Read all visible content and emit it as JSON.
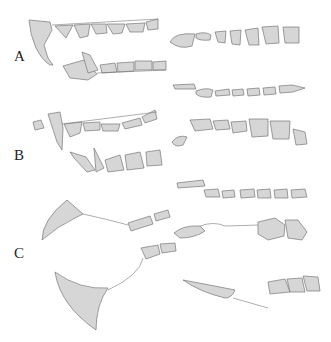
{
  "figure": {
    "panels": [
      {
        "label": "A",
        "description": "Upper and lower jaw dentition, lateral and occlusal views"
      },
      {
        "label": "B",
        "description": "Upper and lower jaw dentition with canines, lateral and occlusal views"
      },
      {
        "label": "C",
        "description": "Mandible outlines with isolated teeth rows and occlusal molars"
      }
    ]
  },
  "colors": {
    "tooth_fill": "#d6d6d6",
    "outline": "#777777",
    "background": "#ffffff",
    "label": "#222222"
  }
}
